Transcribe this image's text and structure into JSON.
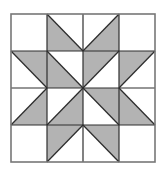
{
  "diagram": {
    "title": "",
    "type": "quilt-block",
    "grid": {
      "rows": 4,
      "cols": 4
    },
    "colors": {
      "fill": "#b3b3b3",
      "background": "#ffffff",
      "line": "#2e2e2e",
      "border": "#777777"
    },
    "cells": [
      [
        {
          "shade": null
        },
        {
          "shade": [
            "TL",
            "BL",
            "BR"
          ]
        },
        {
          "shade": [
            "TR",
            "BL",
            "BR"
          ]
        },
        {
          "shade": null
        }
      ],
      [
        {
          "shade": [
            "TL",
            "TR",
            "BR"
          ]
        },
        {
          "shade": [
            "TL",
            "BL",
            "BR"
          ]
        },
        {
          "shade": [
            "TL",
            "TR",
            "BL"
          ]
        },
        {
          "shade": [
            "TL",
            "TR",
            "BL"
          ]
        }
      ],
      [
        {
          "shade": [
            "TR",
            "BL",
            "BR"
          ]
        },
        {
          "shade": [
            "TR",
            "BL",
            "BR"
          ]
        },
        {
          "shade": [
            "TL",
            "TR",
            "BR"
          ]
        },
        {
          "shade": [
            "TL",
            "BL",
            "BR"
          ]
        }
      ],
      [
        {
          "shade": null
        },
        {
          "shade": [
            "TL",
            "TR",
            "BL"
          ]
        },
        {
          "shade": [
            "TL",
            "TR",
            "BR"
          ]
        },
        {
          "shade": null
        }
      ]
    ]
  }
}
